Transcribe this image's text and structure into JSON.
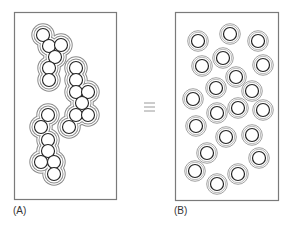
{
  "figure": {
    "symbol": "≡",
    "colors": {
      "border": "#7a7a7a",
      "circle_stroke": "#222222",
      "halo_stroke": "#8a8a8a",
      "symbol": "#9a9a9a",
      "background": "#ffffff"
    },
    "circle_radius": 6.5,
    "halo_radius": 9.5,
    "panels": [
      {
        "id": "A",
        "label": "(A)",
        "description": "Particles aggregated in three clusters, each enclosed by a shared outer boundary",
        "frame": {
          "x": 14,
          "y": 12,
          "w": 102,
          "h": 187
        },
        "clusters": [
          {
            "circles": [
              [
                43,
                35
              ],
              [
                49,
                46
              ],
              [
                61,
                45
              ],
              [
                55,
                57
              ],
              [
                49,
                68
              ],
              [
                49,
                80
              ]
            ]
          },
          {
            "circles": [
              [
                76,
                68
              ],
              [
                76,
                80
              ],
              [
                76,
                92
              ],
              [
                88,
                92
              ],
              [
                82,
                103
              ],
              [
                76,
                115
              ],
              [
                88,
                115
              ],
              [
                69,
                127
              ]
            ]
          },
          {
            "circles": [
              [
                48,
                115
              ],
              [
                41,
                127
              ],
              [
                48,
                140
              ],
              [
                48,
                151
              ],
              [
                41,
                162
              ],
              [
                54,
                162
              ],
              [
                54,
                174
              ]
            ]
          }
        ]
      },
      {
        "id": "B",
        "label": "(B)",
        "description": "Same number of particles dispersed individually, each with its own boundary",
        "frame": {
          "x": 175,
          "y": 12,
          "w": 103,
          "h": 188
        },
        "circles": [
          [
            198,
            41
          ],
          [
            230,
            34
          ],
          [
            258,
            41
          ],
          [
            202,
            66
          ],
          [
            223,
            58
          ],
          [
            263,
            65
          ],
          [
            236,
            77
          ],
          [
            216,
            88
          ],
          [
            252,
            91
          ],
          [
            193,
            99
          ],
          [
            217,
            113
          ],
          [
            238,
            108
          ],
          [
            263,
            110
          ],
          [
            196,
            126
          ],
          [
            226,
            137
          ],
          [
            252,
            135
          ],
          [
            207,
            153
          ],
          [
            259,
            158
          ],
          [
            195,
            171
          ],
          [
            238,
            174
          ],
          [
            217,
            184
          ]
        ]
      }
    ]
  }
}
